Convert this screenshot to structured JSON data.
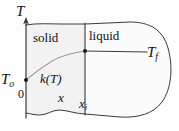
{
  "figure": {
    "colors": {
      "line": "#3a3a3a",
      "curve": "#8a8a8a",
      "solid_fill": "#f2f2f2",
      "liquid_fill": "#fbfbfb",
      "text": "#111111"
    },
    "axis": {
      "vertical_label": "T",
      "origin_label": "0",
      "initial_temperature_label": "T",
      "initial_temperature_sub": "o"
    },
    "regions": {
      "solid_label": "solid",
      "liquid_label": "liquid"
    },
    "annotations": {
      "conductivity_label": "k(T)",
      "position_label": "x",
      "interface_position_label": "x",
      "interface_position_sub": "i",
      "fusion_temperature_label": "T",
      "fusion_temperature_sub": "f"
    }
  }
}
